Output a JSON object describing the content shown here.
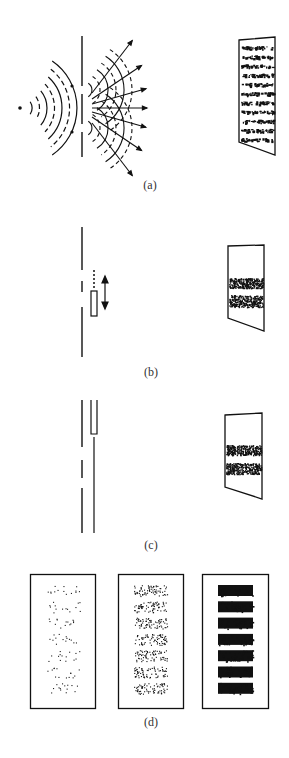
{
  "panels": {
    "a": {
      "label": "(a)",
      "description": "Waves from a point source pass through two slits and interfere, producing an interference pattern on a screen",
      "source_icon": "point-source-dot",
      "screen_fringes": 11
    },
    "b": {
      "label": "(b)",
      "description": "One slit covered by a movable shutter; particles produce a single-slit pattern on the screen",
      "shutter_icon": "double-arrow-icon",
      "screen_bands": 2
    },
    "c": {
      "label": "(c)",
      "description": "One slit covered by a fixed shutter; screen shows a single-slit pattern",
      "screen_bands": 2
    },
    "d": {
      "label": "(d)",
      "description": "Build-up of an interference pattern from individual particle detections at increasing exposure",
      "frames": [
        {
          "name": "sparse",
          "bands": 7,
          "density": "low"
        },
        {
          "name": "medium",
          "bands": 7,
          "density": "medium"
        },
        {
          "name": "dense",
          "bands": 7,
          "density": "high"
        }
      ]
    }
  },
  "colors": {
    "ink": "#111111",
    "background": "#ffffff"
  }
}
